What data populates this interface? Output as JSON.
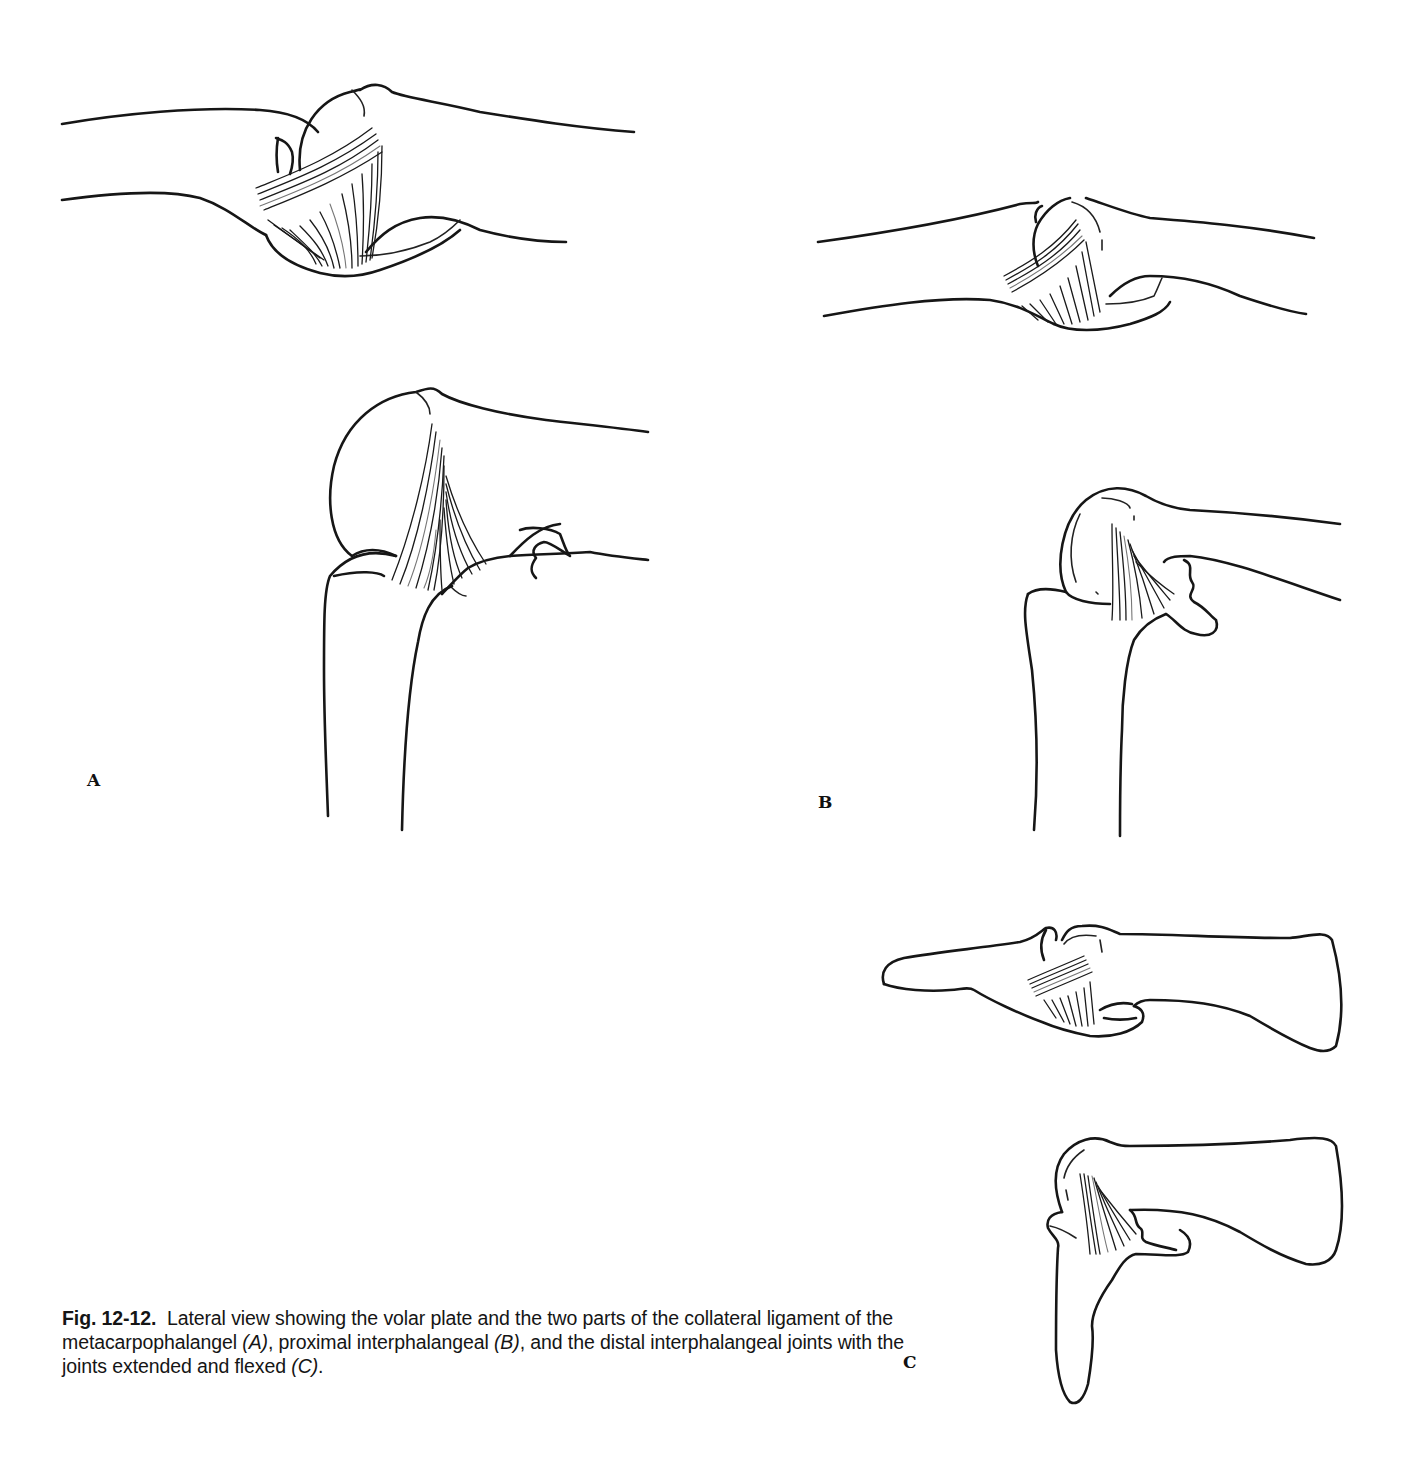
{
  "figure": {
    "number": "Fig. 12-12.",
    "caption_parts": {
      "p1": "Lateral view showing the volar plate and the two parts of the collateral ligament of the metacarpophalangel ",
      "a": "(A)",
      "p2": ", proximal interphalangeal ",
      "b": "(B)",
      "p3": ", and the distal interphalangeal joints with the joints extended and flexed ",
      "c": "(C)",
      "p4": "."
    },
    "panels": [
      {
        "id": "A",
        "label": "A",
        "description": "Metacarpophalangeal joint — extended (top) and flexed (bottom)"
      },
      {
        "id": "B",
        "label": "B",
        "description": "Proximal interphalangeal joint — extended (top) and flexed (bottom)"
      },
      {
        "id": "C",
        "label": "C",
        "description": "Distal interphalangeal joint — extended (top) and flexed (bottom)"
      }
    ]
  }
}
